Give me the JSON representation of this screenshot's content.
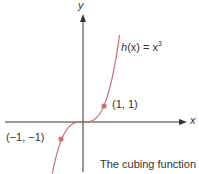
{
  "chart_data": {
    "type": "line",
    "title": "",
    "caption": "The cubing function",
    "function_label": "h(x) = x³",
    "xlabel": "x",
    "ylabel": "y",
    "series": [
      {
        "name": "h(x) = x^3",
        "color": "#c8707a",
        "x": [
          -1.3,
          -1,
          -0.5,
          0,
          0.5,
          1,
          1.5,
          1.75
        ],
        "values": [
          -2.197,
          -1,
          -0.125,
          0,
          0.125,
          1,
          3.375,
          5.359
        ]
      }
    ],
    "points": [
      {
        "x": 1,
        "y": 1,
        "label": "(1, 1)"
      },
      {
        "x": -1,
        "y": -1,
        "label": "(−1, −1)"
      }
    ],
    "grid": false,
    "axis_color": "#333333",
    "point_color": "#c8707a"
  },
  "labels": {
    "x_axis": "x",
    "y_axis": "y",
    "func_h": "h",
    "func_rest": "(x) = x",
    "func_exp": "3",
    "pt1": "(1, 1)",
    "pt2": "(−1, −1)",
    "caption": "The cubing function"
  }
}
